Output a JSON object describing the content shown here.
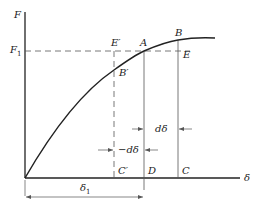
{
  "diagram": {
    "axes": {
      "y_label": "F",
      "x_label": "δ"
    },
    "levels": {
      "F1": "F",
      "F1_sub": "1",
      "delta1": "δ",
      "delta1_sub": "1"
    },
    "points": {
      "E_prime": "E′",
      "A": "A",
      "B": "B",
      "B_prime": "B′",
      "E": "E",
      "C_prime": "C′",
      "D": "D",
      "C": "C"
    },
    "increments": {
      "d_delta": "dδ",
      "neg_d_delta": "−dδ"
    },
    "colors": {
      "line": "#222222",
      "guide": "#555555",
      "background": "#ffffff"
    }
  }
}
